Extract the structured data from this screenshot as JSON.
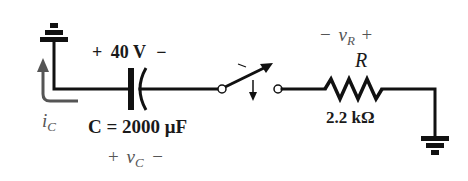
{
  "diagram": {
    "type": "RC circuit schematic",
    "colors": {
      "wire": "#111111",
      "label": "#1a1a1a",
      "annotation": "#555555",
      "background": "#ffffff"
    },
    "capacitor": {
      "voltage_polarity_plus": "+",
      "initial_voltage": "40 V",
      "voltage_polarity_minus": "−",
      "value_label": "C = 2000 μF",
      "voltage_symbol_plus": "+",
      "voltage_symbol": "v",
      "voltage_subscript": "C",
      "voltage_symbol_minus": "−"
    },
    "current": {
      "symbol": "i",
      "subscript": "C"
    },
    "switch": {
      "state": "open (closing)"
    },
    "resistor": {
      "voltage_symbol_minus": "−",
      "voltage_symbol": "v",
      "voltage_subscript": "R",
      "voltage_symbol_plus": "+",
      "name": "R",
      "value": "2.2 kΩ"
    },
    "grounds": [
      "ground-left",
      "ground-right"
    ]
  }
}
